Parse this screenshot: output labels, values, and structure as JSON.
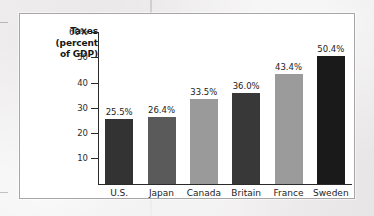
{
  "figure": {
    "frame_border_color": "#a7a5a5",
    "background_color": "#ffffff"
  },
  "chart_data": {
    "type": "bar",
    "title": "",
    "axis_title_lines": [
      "Taxes",
      "(percent",
      "of GDP)"
    ],
    "ylabel": "Taxes (percent of GDP)",
    "xlabel": "",
    "categories": [
      "U.S.",
      "Japan",
      "Canada",
      "Britain",
      "France",
      "Sweden"
    ],
    "values": [
      25.5,
      26.4,
      33.5,
      36.0,
      43.4,
      50.4
    ],
    "value_labels": [
      "25.5%",
      "26.4%",
      "33.5%",
      "36.0%",
      "43.4%",
      "50.4%"
    ],
    "bar_colors": [
      "#333333",
      "#5a5a5a",
      "#9a9a9a",
      "#383838",
      "#9b9b9b",
      "#1a1a1a"
    ],
    "ylim": [
      0,
      60
    ],
    "yticks": [
      10,
      20,
      30,
      40,
      50,
      60
    ],
    "ytick_labels": [
      "10",
      "20",
      "30",
      "40",
      "50",
      "60%"
    ],
    "grid": false,
    "legend": "none"
  }
}
